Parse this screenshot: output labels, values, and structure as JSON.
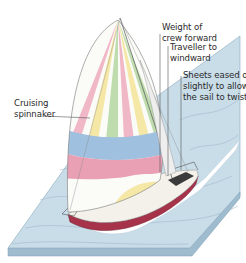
{
  "diagram": {
    "labels": {
      "spinnaker": [
        "Cruising",
        "spinnaker"
      ],
      "crew_weight": [
        "Weight of",
        "crew forward"
      ],
      "traveller": [
        "Traveller to",
        "windward"
      ],
      "sheets": [
        "Sheets eased out",
        "slightly to allow",
        "the sail to twist"
      ]
    },
    "colors": {
      "sea": "#c9dde9",
      "sea_edge": "#9fbccf",
      "sail_stripe_pink": "#f0b7c7",
      "sail_stripe_yellow": "#f5e7a6",
      "sail_stripe_green": "#bfdcae",
      "sail_stripe_white": "#fbfbf8",
      "sail_band_blue": "#9fc0de",
      "sail_band_pink": "#e9a0b4",
      "hull": "#a6334a",
      "deck": "#f4f1ea",
      "wake": "#ffffff",
      "leader_line": "#555555"
    }
  }
}
